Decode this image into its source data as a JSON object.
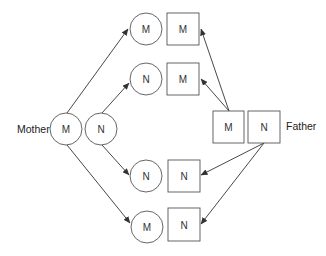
{
  "diagram": {
    "type": "inheritance-diagram",
    "parents": {
      "mother": {
        "label": "Mother",
        "shape": "circle",
        "alleles": [
          "M",
          "N"
        ]
      },
      "father": {
        "label": "Father",
        "shape": "square",
        "alleles": [
          "M",
          "N"
        ]
      }
    },
    "offspring": [
      {
        "maternal": "M",
        "paternal": "M"
      },
      {
        "maternal": "N",
        "paternal": "M"
      },
      {
        "maternal": "N",
        "paternal": "N"
      },
      {
        "maternal": "M",
        "paternal": "N"
      }
    ],
    "edges": [
      {
        "from": "mother.M",
        "to": "offspring.0.maternal"
      },
      {
        "from": "mother.N",
        "to": "offspring.1.maternal"
      },
      {
        "from": "mother.N",
        "to": "offspring.2.maternal"
      },
      {
        "from": "mother.M",
        "to": "offspring.3.maternal"
      },
      {
        "from": "father.M",
        "to": "offspring.0.paternal"
      },
      {
        "from": "father.M",
        "to": "offspring.1.paternal"
      },
      {
        "from": "father.N",
        "to": "offspring.2.paternal"
      },
      {
        "from": "father.N",
        "to": "offspring.3.paternal"
      }
    ],
    "colors": {
      "stroke": "#555555",
      "arrow": "#333333",
      "text": "#333333",
      "background": "#ffffff"
    }
  }
}
